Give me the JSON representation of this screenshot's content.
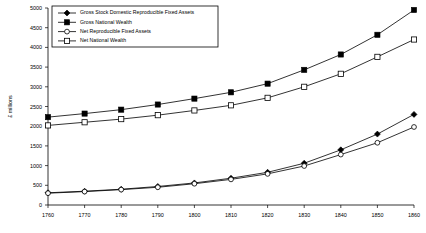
{
  "chart_data": {
    "type": "line",
    "title": "",
    "subtitle": "",
    "xlabel": "",
    "ylabel": "£ millions",
    "x": [
      1760,
      1770,
      1780,
      1790,
      1800,
      1810,
      1820,
      1830,
      1840,
      1850,
      1860
    ],
    "xlim": [
      1760,
      1860
    ],
    "ylim": [
      0,
      5000
    ],
    "xticks": [
      "1760",
      "1770",
      "1780",
      "1790",
      "1800",
      "1810",
      "1820",
      "1830",
      "1840",
      "1850",
      "1860"
    ],
    "yticks": [
      "0",
      "500",
      "1000",
      "1500",
      "2000",
      "2500",
      "3000",
      "3500",
      "4000",
      "4500",
      "5000"
    ],
    "grid": false,
    "legend_position": "top-left",
    "series": [
      {
        "name": "Gross Stock Domestic Reproducible Fixed Assets",
        "marker": "filled-diamond",
        "values": [
          310,
          350,
          400,
          470,
          560,
          680,
          830,
          1060,
          1400,
          1800,
          2300
        ]
      },
      {
        "name": "Gross National Wealth",
        "marker": "filled-square",
        "values": [
          2230,
          2320,
          2420,
          2550,
          2700,
          2860,
          3080,
          3430,
          3820,
          4320,
          4950
        ]
      },
      {
        "name": "Net Reproducible Fixed Assets",
        "marker": "open-circle",
        "values": [
          300,
          340,
          390,
          450,
          540,
          650,
          790,
          990,
          1280,
          1580,
          1980
        ]
      },
      {
        "name": "Net National Wealth",
        "marker": "open-square",
        "values": [
          2020,
          2100,
          2180,
          2280,
          2400,
          2530,
          2720,
          3000,
          3330,
          3760,
          4200
        ]
      }
    ]
  },
  "legend": {
    "items": [
      {
        "label": "Gross Stock Domestic Reproducible Fixed Assets",
        "marker": "filled-diamond"
      },
      {
        "label": "Gross National Wealth",
        "marker": "filled-square"
      },
      {
        "label": "Net Reproducible Fixed Assets",
        "marker": "open-circle"
      },
      {
        "label": "Net National Wealth",
        "marker": "open-square"
      }
    ]
  },
  "colors": {
    "background": "#ffffff",
    "ink": "#000000"
  }
}
